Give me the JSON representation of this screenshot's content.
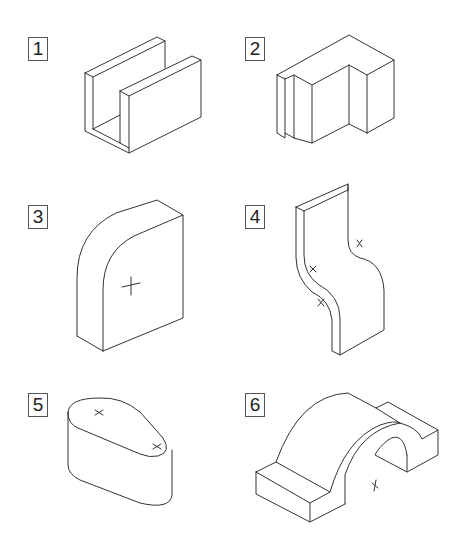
{
  "figures": [
    {
      "number": "1",
      "shape": "U-channel block",
      "markers": 0
    },
    {
      "number": "2",
      "shape": "stepped L-block with slot",
      "markers": 0
    },
    {
      "number": "3",
      "shape": "block with rounded corner",
      "markers": 1
    },
    {
      "number": "4",
      "shape": "S-curved plate",
      "markers": 3
    },
    {
      "number": "5",
      "shape": "tapered rounded slot block",
      "markers": 2
    },
    {
      "number": "6",
      "shape": "arch bridge block with pads",
      "markers": 1
    }
  ],
  "colors": {
    "line": "#333333",
    "background": "#ffffff",
    "label_border": "#555555"
  }
}
